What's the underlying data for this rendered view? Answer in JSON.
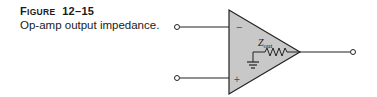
{
  "caption": {
    "figure_prefix": "F",
    "figure_prefix_small": "IGURE",
    "figure_number": "12–15",
    "title": "Op-amp output impedance."
  },
  "diagram": {
    "type": "op-amp schematic",
    "inputs": [
      {
        "name": "inverting",
        "symbol": "−"
      },
      {
        "name": "non-inverting",
        "symbol": "+"
      }
    ],
    "internal": {
      "impedance_label_main": "Z",
      "impedance_label_sub": "out",
      "components": [
        "resistor",
        "ground"
      ]
    },
    "output": {
      "name": "output terminal"
    },
    "colors": {
      "amp_fill": "#c8c8c8",
      "stroke": "#222222",
      "background": "#ffffff"
    }
  }
}
